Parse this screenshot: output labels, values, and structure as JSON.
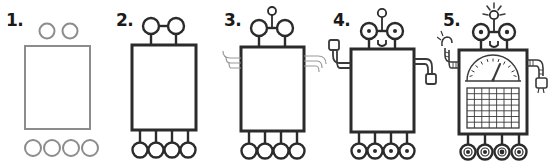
{
  "image": {
    "title": "How to draw a robot - 5 step tutorial",
    "background_color": "#ffffff",
    "width": 553,
    "height": 166
  },
  "style": {
    "draft_stroke_color": "#8c8c8c",
    "ink_stroke_color": "#2b2b2b",
    "detail_stroke_color": "#3a3a3a",
    "fill_color": "#ffffff",
    "number_color": "#1a1a1a"
  },
  "steps": [
    {
      "number": "1.",
      "label": "step-1",
      "x": 0,
      "description": "Body rectangle with two loose circles above and four loose circles below",
      "stroke": "#8c8c8c",
      "parts": [
        "body-rectangle",
        "eye-circle-left",
        "eye-circle-right",
        "foot-circle-1",
        "foot-circle-2",
        "foot-circle-3",
        "foot-circle-4"
      ]
    },
    {
      "number": "2.",
      "label": "step-2",
      "x": 110,
      "description": "Body inked, eyes joined by a bar on stalks, legs connect feet to body",
      "stroke": "#2b2b2b",
      "parts": [
        "body-rectangle",
        "eye-bar",
        "eye-stalks",
        "legs",
        "feet"
      ]
    },
    {
      "number": "3.",
      "label": "step-3",
      "x": 218,
      "description": "Antenna added on top of head, arm outlines sketched on both sides",
      "stroke": "#2b2b2b",
      "parts": [
        "antenna",
        "antenna-bulb",
        "arm-outline-left",
        "arm-outline-right"
      ]
    },
    {
      "number": "4.",
      "label": "step-4",
      "x": 327,
      "description": "Pupils, smiling mouth, hands on arms and hubs in the wheels",
      "stroke": "#2b2b2b",
      "parts": [
        "pupils",
        "mouth",
        "hand-left",
        "hand-right",
        "wheel-hubs"
      ]
    },
    {
      "number": "5.",
      "label": "step-5",
      "x": 437,
      "description": "Finished robot with gauge dial, grid panel, segmented arms and glowing antenna",
      "stroke": "#2b2b2b",
      "parts": [
        "gauge",
        "gauge-needle",
        "grid-panel",
        "segmented-arms",
        "claw-hand",
        "plug-hand",
        "antenna-rays"
      ]
    }
  ],
  "gauge": {
    "name": "gauge-dial",
    "tick_count": 11,
    "needle_angle_deg": 60,
    "shape": "semicircle"
  },
  "grid_panel": {
    "name": "grid-panel",
    "columns": 7,
    "rows": 7
  },
  "counts": {
    "eyes": 2,
    "legs": 4,
    "arms": 2,
    "antennas": 1
  }
}
